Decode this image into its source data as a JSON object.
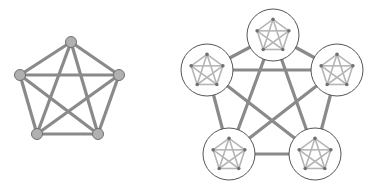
{
  "diagram": {
    "colors": {
      "edge": "#8a8a8a",
      "node_fill": "#b0b0b0",
      "node_stroke": "#707070",
      "inner_edge": "#b5b5b5",
      "inner_node": "#707070",
      "circle_stroke": "#555555",
      "background": "#ffffff"
    },
    "left_graph": {
      "type": "K5",
      "nodes": [
        [
          71,
          42
        ],
        [
          20,
          75
        ],
        [
          119,
          75
        ],
        [
          37,
          134
        ],
        [
          98,
          134
        ]
      ]
    },
    "right_graph": {
      "type": "K5 of K5",
      "clusters": [
        [
          273,
          35
        ],
        [
          207,
          70
        ],
        [
          337,
          70
        ],
        [
          229,
          154
        ],
        [
          315,
          154
        ]
      ],
      "cluster_radius": 26,
      "inner_radius": 17
    }
  }
}
